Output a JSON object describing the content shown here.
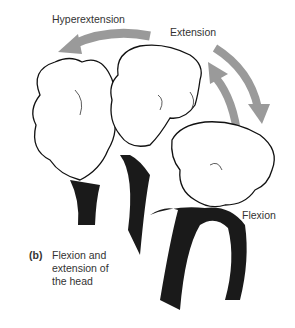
{
  "labels": {
    "hyperextension": "Hyperextension",
    "extension": "Extension",
    "flexion": "Flexion"
  },
  "caption": {
    "tag": "(b)",
    "line1": "Flexion and",
    "line2": "extension of",
    "line3": "the head"
  },
  "colors": {
    "arrow": "#9a9a9a",
    "outline": "#111111",
    "tank_top": "#1a1a1a",
    "text": "#333333"
  }
}
